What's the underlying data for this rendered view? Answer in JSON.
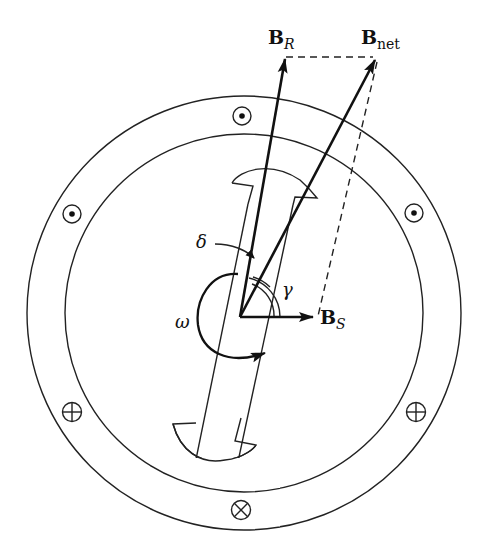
{
  "diagram": {
    "labels": {
      "rotor_field": {
        "main": "B",
        "sub": "R"
      },
      "net_field": {
        "main": "B",
        "sub": "net"
      },
      "stator_field": {
        "main": "B",
        "sub": "S"
      },
      "torque_angle": "δ",
      "angle_gamma": "γ",
      "angular_velocity": "ω"
    },
    "conductor_symbols": {
      "out_of_page": "dot",
      "into_page": "cross"
    },
    "conductors": [
      {
        "position": "top",
        "direction": "out_of_page"
      },
      {
        "position": "upper-left",
        "direction": "out_of_page"
      },
      {
        "position": "upper-right",
        "direction": "out_of_page"
      },
      {
        "position": "lower-left",
        "direction": "into_page"
      },
      {
        "position": "lower-right",
        "direction": "into_page"
      },
      {
        "position": "bottom",
        "direction": "into_page"
      }
    ]
  }
}
